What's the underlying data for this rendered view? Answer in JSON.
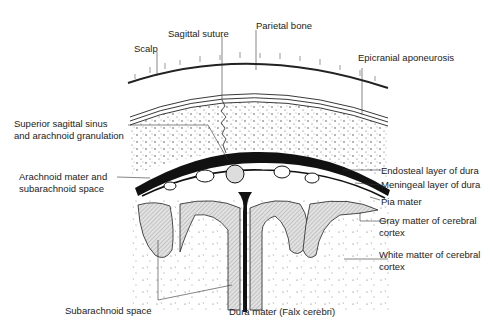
{
  "figure": {
    "labels": {
      "sagittal_suture": "Sagittal suture",
      "parietal_bone": "Parietal bone",
      "scalp": "Scalp",
      "epicranial_aponeurosis": "Epicranial aponeurosis",
      "superior_sagittal_sinus_line1": "Superior sagittal sinus",
      "superior_sagittal_sinus_line2": "and arachnoid granulation",
      "arachnoid_mater_line1": "Arachnoid mater and",
      "arachnoid_mater_line2": "subarachnoid space",
      "endosteal_layer": "Endosteal layer of dura",
      "meningeal_layer": "Meningeal layer of dura",
      "pia_mater": "Pia mater",
      "gray_matter_line1": "Gray matter of cerebral",
      "gray_matter_line2": "cortex",
      "white_matter_line1": "White matter of cerebral",
      "white_matter_line2": "cortex",
      "subarachnoid_space": "Subarachnoid space",
      "dura_mater_falx": "Dura mater (Falx cerebri)"
    },
    "colors": {
      "ink": "#111111",
      "gray_matter_fill": "#d9d9d9",
      "background": "#ffffff"
    }
  }
}
